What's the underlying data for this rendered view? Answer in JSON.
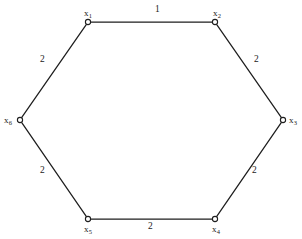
{
  "figure": {
    "type": "weighted-graph-diagram",
    "shape": "hexagon",
    "background_color": "#ffffff",
    "line_color": "#1e1e1e",
    "text_color": "#1a1a1a"
  },
  "chart_data": {
    "type": "diagram",
    "title": "",
    "vertices": [
      {
        "id": "x1",
        "base": "x",
        "sub": "1",
        "x": 88,
        "y": 22,
        "label_dx": -4,
        "label_dy": -13
      },
      {
        "id": "x2",
        "base": "x",
        "sub": "2",
        "x": 215,
        "y": 22,
        "label_dx": -2,
        "label_dy": -13
      },
      {
        "id": "x3",
        "base": "x",
        "sub": "3",
        "x": 283,
        "y": 120,
        "label_dx": 6,
        "label_dy": -4
      },
      {
        "id": "x4",
        "base": "x",
        "sub": "4",
        "x": 215,
        "y": 219,
        "label_dx": -3,
        "label_dy": 6
      },
      {
        "id": "x5",
        "base": "x",
        "sub": "5",
        "x": 88,
        "y": 219,
        "label_dx": -4,
        "label_dy": 6
      },
      {
        "id": "x6",
        "base": "x",
        "sub": "6",
        "x": 20,
        "y": 120,
        "label_dx": -16,
        "label_dy": -4
      }
    ],
    "edges": [
      {
        "from": "x1",
        "to": "x2",
        "weight": "1",
        "label_x": 155,
        "label_y": 5
      },
      {
        "from": "x2",
        "to": "x3",
        "weight": "2",
        "label_x": 254,
        "label_y": 55
      },
      {
        "from": "x3",
        "to": "x4",
        "weight": "2",
        "label_x": 252,
        "label_y": 166
      },
      {
        "from": "x4",
        "to": "x5",
        "weight": "2",
        "label_x": 148,
        "label_y": 222
      },
      {
        "from": "x5",
        "to": "x6",
        "weight": "2",
        "label_x": 40,
        "label_y": 166
      },
      {
        "from": "x6",
        "to": "x1",
        "weight": "2",
        "label_x": 40,
        "label_y": 55
      }
    ]
  }
}
